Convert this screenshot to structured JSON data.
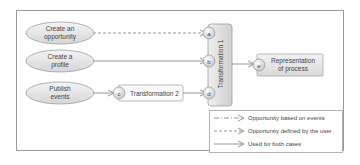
{
  "diagram": {
    "sources": [
      {
        "id": "create-opportunity",
        "line1": "Create an",
        "line2": "opportunity"
      },
      {
        "id": "create-profile",
        "line1": "Create a",
        "line2": "profile"
      },
      {
        "id": "publish-events",
        "line1": "Publish",
        "line2": "events"
      }
    ],
    "transformation1": {
      "label": "Transformation 1",
      "ports": [
        "a",
        "b",
        "d"
      ]
    },
    "transformation2": {
      "label": "Transformation 2",
      "port": "c"
    },
    "representation": {
      "port": "e",
      "line1": "Representation",
      "line2": "of process"
    },
    "legend": [
      {
        "style": "dash-dot",
        "label": "Opportunity based on events"
      },
      {
        "style": "dashed",
        "label": "Opportunity defined by the user"
      },
      {
        "style": "solid",
        "label": "Used for both cases"
      }
    ],
    "colors": {
      "frame": "#9a9a9a",
      "node_fill": "#e6e6e6",
      "node_stroke": "#a0a0a0",
      "line": "#8a8a8a",
      "text": "#444444"
    }
  }
}
